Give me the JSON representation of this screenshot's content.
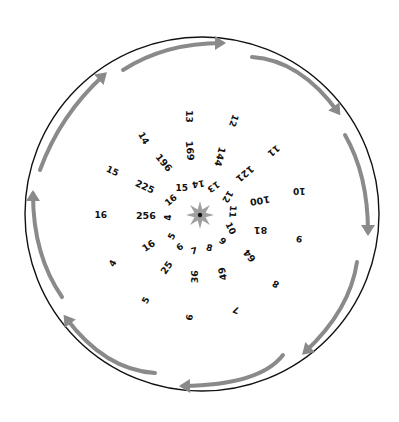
{
  "diagram": {
    "type": "circular-number-spiral",
    "boundary_circle": {
      "cx": 202,
      "cy": 214,
      "r": 177,
      "stroke": "#111111"
    },
    "center_star": {
      "cx": 200,
      "cy": 215,
      "points": 8,
      "outer_r": 14,
      "inner_r": 6,
      "fill": "#a0a0a0",
      "dot_color": "#111111"
    },
    "arrow_color": "#8a8a8a",
    "arrow_direction": "clockwise",
    "arrows": [
      {
        "name": "arrow-top",
        "path": "M 123 70 Q 165 43 222 43",
        "head": [
          222,
          43
        ],
        "angle": 0
      },
      {
        "name": "arrow-upper-right",
        "path": "M 252 57 Q 300 60 338 112",
        "head": [
          338,
          112
        ],
        "angle": 40
      },
      {
        "name": "arrow-right",
        "path": "M 345 135 Q 368 175 368 232",
        "head": [
          368,
          232
        ],
        "angle": 90
      },
      {
        "name": "arrow-lower-right",
        "path": "M 357 262 Q 350 310 305 352",
        "head": [
          305,
          352
        ],
        "angle": 135
      },
      {
        "name": "arrow-bottom",
        "path": "M 283 355 Q 260 385 183 386",
        "head": [
          183,
          386
        ],
        "angle": 180
      },
      {
        "name": "arrow-lower-left",
        "path": "M 155 373 Q 105 370 66 318",
        "head": [
          66,
          318
        ],
        "angle": 225
      },
      {
        "name": "arrow-left",
        "path": "M 62 297 Q 33 255 33 194",
        "head": [
          33,
          194
        ],
        "angle": 270
      },
      {
        "name": "arrow-upper-left",
        "path": "M 40 170 Q 60 115 104 75",
        "head": [
          104,
          75
        ],
        "angle": 315
      }
    ],
    "rings": {
      "inner": [
        {
          "text": "4",
          "x": 168,
          "y": 217,
          "rot": -90
        },
        {
          "text": "5",
          "x": 172,
          "y": 236,
          "rot": -60
        },
        {
          "text": "6",
          "x": 180,
          "y": 247,
          "rot": -35
        },
        {
          "text": "7",
          "x": 194,
          "y": 251,
          "rot": -10
        },
        {
          "text": "8",
          "x": 209,
          "y": 248,
          "rot": 15
        },
        {
          "text": "9",
          "x": 222,
          "y": 241,
          "rot": 40
        },
        {
          "text": "10",
          "x": 230,
          "y": 228,
          "rot": 65
        },
        {
          "text": "11",
          "x": 232,
          "y": 211,
          "rot": 95
        },
        {
          "text": "12",
          "x": 227,
          "y": 196,
          "rot": 120
        },
        {
          "text": "13",
          "x": 213,
          "y": 186,
          "rot": 145
        },
        {
          "text": "14",
          "x": 198,
          "y": 183,
          "rot": 170
        },
        {
          "text": "15",
          "x": 182,
          "y": 188,
          "rot": 0
        },
        {
          "text": "16",
          "x": 171,
          "y": 200,
          "rot": -40
        }
      ],
      "middle": [
        {
          "text": "16",
          "x": 148,
          "y": 246,
          "rot": -35
        },
        {
          "text": "25",
          "x": 166,
          "y": 268,
          "rot": -55
        },
        {
          "text": "36",
          "x": 194,
          "y": 277,
          "rot": -90
        },
        {
          "text": "49",
          "x": 222,
          "y": 274,
          "rot": -100
        },
        {
          "text": "64",
          "x": 249,
          "y": 256,
          "rot": -130
        },
        {
          "text": "81",
          "x": 260,
          "y": 230,
          "rot": 180
        },
        {
          "text": "100",
          "x": 260,
          "y": 201,
          "rot": 170
        },
        {
          "text": "121",
          "x": 245,
          "y": 174,
          "rot": 140
        },
        {
          "text": "144",
          "x": 220,
          "y": 157,
          "rot": 105
        },
        {
          "text": "169",
          "x": 190,
          "y": 151,
          "rot": 85
        },
        {
          "text": "196",
          "x": 164,
          "y": 163,
          "rot": 50
        },
        {
          "text": "225",
          "x": 145,
          "y": 187,
          "rot": 25
        },
        {
          "text": "256",
          "x": 146,
          "y": 216,
          "rot": 0
        }
      ],
      "outer": [
        {
          "text": "4",
          "x": 113,
          "y": 263,
          "rot": -60
        },
        {
          "text": "5",
          "x": 146,
          "y": 300,
          "rot": -60
        },
        {
          "text": "6",
          "x": 190,
          "y": 317,
          "rot": -80
        },
        {
          "text": "7",
          "x": 236,
          "y": 309,
          "rot": -160
        },
        {
          "text": "8",
          "x": 276,
          "y": 283,
          "rot": -150
        },
        {
          "text": "9",
          "x": 299,
          "y": 238,
          "rot": -170
        },
        {
          "text": "10",
          "x": 299,
          "y": 190,
          "rot": 180
        },
        {
          "text": "11",
          "x": 273,
          "y": 150,
          "rot": 140
        },
        {
          "text": "12",
          "x": 233,
          "y": 120,
          "rot": 110
        },
        {
          "text": "13",
          "x": 188,
          "y": 116,
          "rot": 90
        },
        {
          "text": "14",
          "x": 143,
          "y": 138,
          "rot": 60
        },
        {
          "text": "15",
          "x": 112,
          "y": 171,
          "rot": 25
        },
        {
          "text": "16",
          "x": 101,
          "y": 215,
          "rot": 0
        }
      ]
    }
  }
}
